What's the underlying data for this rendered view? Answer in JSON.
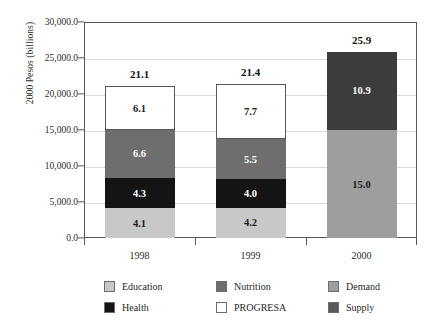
{
  "chart_data": {
    "type": "bar",
    "subtype": "stacked-bar",
    "title": "",
    "xlabel": "",
    "ylabel": "2000 Pesos (billions)",
    "categories": [
      "1998",
      "1999",
      "2000"
    ],
    "ylim": [
      0,
      30000
    ],
    "ytick_values": [
      0,
      5000,
      10000,
      15000,
      20000,
      25000,
      30000
    ],
    "ytick_labels": [
      "0.0",
      "5,000.0",
      "10,000.0",
      "15,000.0",
      "20,000.0",
      "25,000.0",
      "30,000.0"
    ],
    "grid": true,
    "value_scale_note": "segment labels are in billions; axis is in millions (label x 1000)",
    "legend_position": "bottom",
    "series": [
      {
        "name": "Education",
        "color": "#c8c8c8",
        "label_color": "#1a1a1a",
        "values": [
          4.1,
          4.2,
          null
        ]
      },
      {
        "name": "Health",
        "color": "#141414",
        "label_color": "#ffffff",
        "values": [
          4.3,
          4.0,
          null
        ]
      },
      {
        "name": "Nutrition",
        "color": "#6e6e6e",
        "label_color": "#ffffff",
        "values": [
          6.6,
          5.5,
          null
        ]
      },
      {
        "name": "PROGRESA",
        "color": "#ffffff",
        "label_color": "#1a1a1a",
        "values": [
          6.1,
          7.7,
          null
        ]
      },
      {
        "name": "Demand",
        "color": "#9e9e9e",
        "label_color": "#1a1a1a",
        "values": [
          null,
          null,
          15.0
        ]
      },
      {
        "name": "Supply",
        "color": "#3c3c3c",
        "label_color": "#ffffff",
        "values": [
          null,
          null,
          10.9
        ]
      }
    ],
    "totals": [
      21.1,
      21.4,
      25.9
    ],
    "bars": [
      {
        "category": "1998",
        "total_label": "21.1",
        "segments": [
          {
            "name": "Education",
            "label": "4.1",
            "value": 4.1,
            "color": "#c8c8c8",
            "text_color": "#1a1a1a",
            "outlined": false
          },
          {
            "name": "Health",
            "label": "4.3",
            "value": 4.3,
            "color": "#141414",
            "text_color": "#ffffff",
            "outlined": false
          },
          {
            "name": "Nutrition",
            "label": "6.6",
            "value": 6.6,
            "color": "#6e6e6e",
            "text_color": "#ffffff",
            "outlined": false
          },
          {
            "name": "PROGRESA",
            "label": "6.1",
            "value": 6.1,
            "color": "#ffffff",
            "text_color": "#1a1a1a",
            "outlined": true
          }
        ]
      },
      {
        "category": "1999",
        "total_label": "21.4",
        "segments": [
          {
            "name": "Education",
            "label": "4.2",
            "value": 4.2,
            "color": "#c8c8c8",
            "text_color": "#1a1a1a",
            "outlined": false
          },
          {
            "name": "Health",
            "label": "4.0",
            "value": 4.0,
            "color": "#141414",
            "text_color": "#ffffff",
            "outlined": false
          },
          {
            "name": "Nutrition",
            "label": "5.5",
            "value": 5.5,
            "color": "#6e6e6e",
            "text_color": "#ffffff",
            "outlined": false
          },
          {
            "name": "PROGRESA",
            "label": "7.7",
            "value": 7.7,
            "color": "#ffffff",
            "text_color": "#1a1a1a",
            "outlined": true
          }
        ]
      },
      {
        "category": "2000",
        "total_label": "25.9",
        "segments": [
          {
            "name": "Demand",
            "label": "15.0",
            "value": 15.0,
            "color": "#9e9e9e",
            "text_color": "#1a1a1a",
            "outlined": false
          },
          {
            "name": "Supply",
            "label": "10.9",
            "value": 10.9,
            "color": "#3c3c3c",
            "text_color": "#ffffff",
            "outlined": false
          }
        ]
      }
    ],
    "legend": [
      {
        "label": "Education",
        "color": "#c8c8c8"
      },
      {
        "label": "Nutrition",
        "color": "#6e6e6e"
      },
      {
        "label": "Demand",
        "color": "#9e9e9e"
      },
      {
        "label": "Health",
        "color": "#141414"
      },
      {
        "label": "PROGRESA",
        "color": "#ffffff"
      },
      {
        "label": "Supply",
        "color": "#5a5a5a"
      }
    ]
  },
  "axis": {
    "y_title": "2000 Pesos (billions)"
  },
  "colors": {
    "axis_line": "#55565a",
    "gridline": "#d9d9d9",
    "background": "#ffffff"
  }
}
